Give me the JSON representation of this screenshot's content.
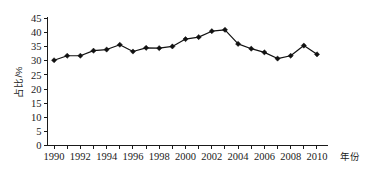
{
  "chart_data": {
    "type": "line",
    "title": "",
    "subtitle": "",
    "xlabel": "年份",
    "ylabel": "占比/%",
    "xlim": [
      1989.5,
      2010.8
    ],
    "ylim": [
      0,
      45
    ],
    "grid": false,
    "legend": null,
    "legend_position": "none",
    "marker": "diamond",
    "line_color": "#111111",
    "marker_color": "#111111",
    "x": [
      1990,
      1991,
      1992,
      1993,
      1994,
      1995,
      1996,
      1997,
      1998,
      1999,
      2000,
      2001,
      2002,
      2003,
      2004,
      2005,
      2006,
      2007,
      2008,
      2009,
      2010
    ],
    "values": [
      30.2,
      31.8,
      31.8,
      33.6,
      34.0,
      35.7,
      33.3,
      34.6,
      34.5,
      35.1,
      37.7,
      38.4,
      40.5,
      41.0,
      36.0,
      34.3,
      33.0,
      30.8,
      31.8,
      35.4,
      32.3
    ],
    "y_ticks": [
      0,
      5,
      10,
      15,
      20,
      25,
      30,
      35,
      40,
      45
    ],
    "y_tick_labels": [
      "0",
      "5",
      "10",
      "15",
      "20",
      "25",
      "30",
      "35",
      "40",
      "45"
    ],
    "x_ticks": [
      1990,
      1991,
      1992,
      1993,
      1994,
      1995,
      1996,
      1997,
      1998,
      1999,
      2000,
      2001,
      2002,
      2003,
      2004,
      2005,
      2006,
      2007,
      2008,
      2009,
      2010
    ],
    "x_tick_labels": [
      "1990",
      "",
      "1992",
      "",
      "1994",
      "",
      "1996",
      "",
      "1998",
      "",
      "2000",
      "",
      "2002",
      "",
      "2004",
      "",
      "2006",
      "",
      "2008",
      "",
      "2010"
    ]
  }
}
